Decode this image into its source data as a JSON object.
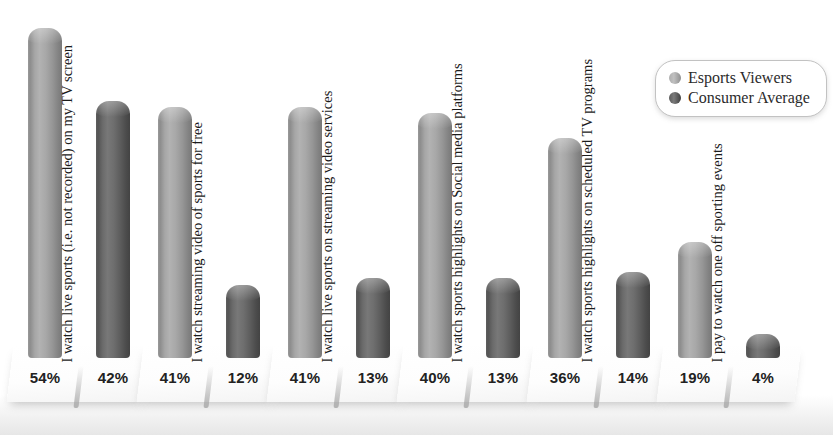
{
  "chart_data": {
    "type": "bar",
    "title": "",
    "subtitle": "",
    "xlabel": "",
    "ylabel": "",
    "grid": false,
    "legend_position": "top-right",
    "ylim": [
      0,
      60
    ],
    "value_suffix": "%",
    "categories": [
      "I watch live sports (i.e. not recorded) on my TV screen",
      "I watch streaming video of sports for free",
      "I watch live sports on streaming video services",
      "I watch sports highlights on Social media platforms",
      "I watch sports highlights on scheduled TV programs",
      "I pay to watch one off sporting events"
    ],
    "series": [
      {
        "name": "Esports Viewers",
        "color": "#a8a8a8",
        "values": [
          54,
          41,
          41,
          40,
          36,
          19
        ],
        "labels": [
          "54%",
          "41%",
          "41%",
          "40%",
          "36%",
          "19%"
        ]
      },
      {
        "name": "Consumer Average",
        "color": "#5e5e5e",
        "values": [
          42,
          12,
          13,
          13,
          14,
          4
        ],
        "labels": [
          "42%",
          "12%",
          "13%",
          "13%",
          "14%",
          "4%"
        ]
      }
    ]
  },
  "legend": {
    "entries": [
      {
        "label": "Esports Viewers"
      },
      {
        "label": "Consumer Average"
      }
    ]
  }
}
